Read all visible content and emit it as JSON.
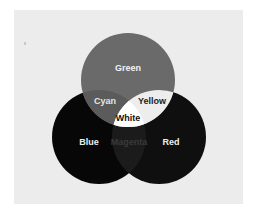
{
  "diagram": {
    "type": "venn-3",
    "background_color": "#ececec",
    "circles": [
      {
        "id": "green",
        "label": "Green",
        "cx": 128,
        "cy": 80,
        "r": 47,
        "fill": "#6a6a6a"
      },
      {
        "id": "blue",
        "label": "Blue",
        "cx": 99,
        "cy": 137,
        "r": 47,
        "fill": "#070707"
      },
      {
        "id": "red",
        "label": "Red",
        "cx": 159,
        "cy": 137,
        "r": 47,
        "fill": "#0f0f0f"
      }
    ],
    "overlaps": [
      {
        "id": "cyan",
        "label": "Cyan",
        "sets": [
          "green",
          "blue"
        ],
        "fill": "#5b5b5b"
      },
      {
        "id": "yellow",
        "label": "Yellow",
        "sets": [
          "green",
          "red"
        ],
        "fill": "#ededed"
      },
      {
        "id": "magenta",
        "label": "Magenta",
        "sets": [
          "blue",
          "red"
        ],
        "fill": "#1b1b1b"
      },
      {
        "id": "white",
        "label": "White",
        "sets": [
          "green",
          "blue",
          "red"
        ],
        "fill": "#ffffff"
      }
    ]
  },
  "labels": {
    "green": "Green",
    "cyan": "Cyan",
    "yellow": "Yellow",
    "white": "White",
    "blue": "Blue",
    "magenta": "Magenta",
    "red": "Red"
  }
}
